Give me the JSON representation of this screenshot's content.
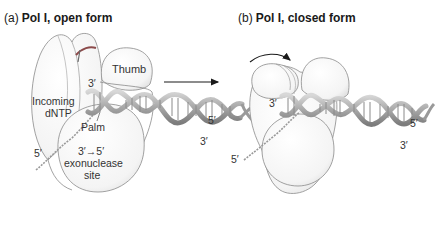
{
  "panels": [
    {
      "tag": "(a)",
      "title": "Pol I, open form",
      "labels": {
        "thumb": "Thumb",
        "incoming_line1": "Incoming",
        "incoming_line2": "dNTP",
        "palm": "Palm",
        "exo_line1": "3′→5′",
        "exo_line2": "exonuclease",
        "exo_line3": "site",
        "primer_3prime": "3′",
        "template_5prime_left": "5′",
        "dna_end_5prime": "5′",
        "dna_end_3prime": "3′"
      }
    },
    {
      "tag": "(b)",
      "title": "Pol I, closed form",
      "labels": {
        "primer_3prime": "3′",
        "template_5prime_left": "5′",
        "dna_end_5prime": "5′",
        "dna_end_3prime": "3′"
      }
    }
  ],
  "transition_arrow": "open-to-closed",
  "colors": {
    "outline": "#8a8a8a",
    "domain_fill": "#f7f7f7",
    "dna_strand": "#b5b5b5",
    "dna_dark": "#7a7a7a",
    "red_strand": "#8b4a4a",
    "text": "#333333"
  }
}
